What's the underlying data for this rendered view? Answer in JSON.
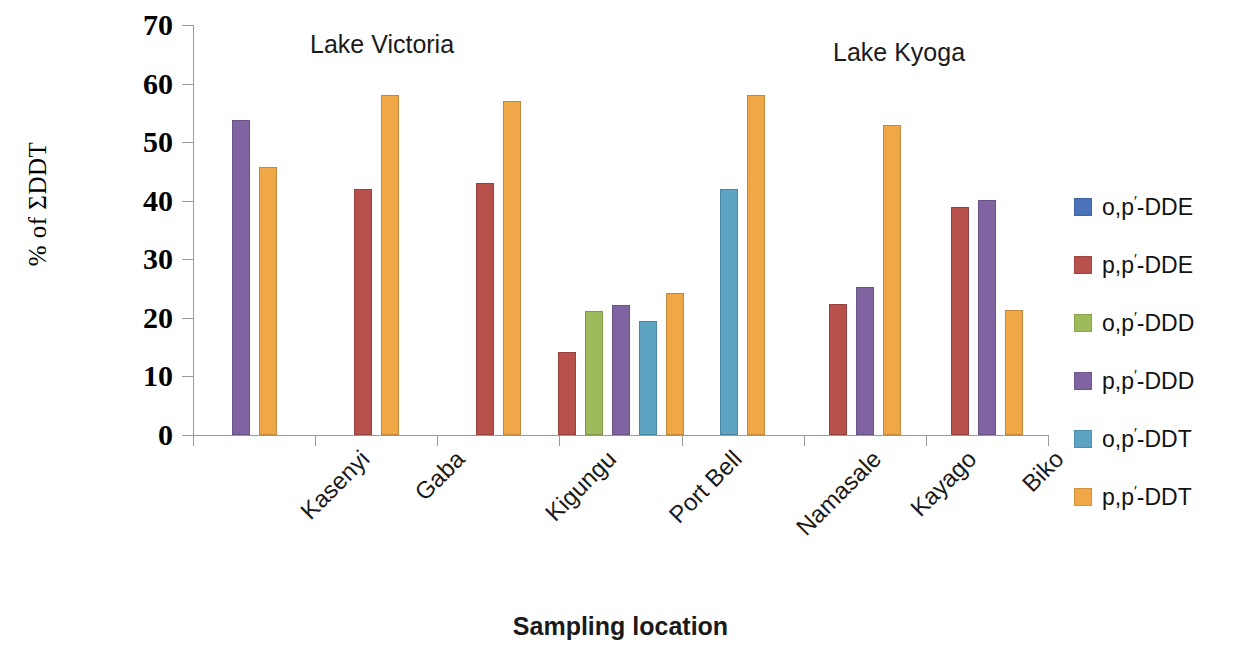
{
  "chart_data": {
    "type": "bar",
    "title": "",
    "xlabel": "Sampling location",
    "ylabel": "% of ΣDDT",
    "ylim": [
      0,
      70
    ],
    "yticks": [
      0,
      10,
      20,
      30,
      40,
      50,
      60,
      70
    ],
    "ytick_labels": [
      "0",
      "10",
      "20",
      "30",
      "40",
      "50",
      "60",
      "70"
    ],
    "grid": false,
    "legend_position": "right",
    "categories": [
      "Kasenyi",
      "Gaba",
      "Kigungu",
      "Port Bell",
      "Namasale",
      "Kayago",
      "Biko"
    ],
    "series": [
      {
        "name": "o,p'-DDE",
        "color": "#4a72b8",
        "values": [
          null,
          null,
          null,
          null,
          null,
          null,
          null
        ]
      },
      {
        "name": "p,p'-DDE",
        "color": "#b8504c",
        "values": [
          null,
          42,
          43,
          14.2,
          null,
          22.3,
          39
        ]
      },
      {
        "name": "o,p'-DDD",
        "color": "#9dbb5a",
        "values": [
          null,
          null,
          null,
          21.2,
          null,
          null,
          null
        ]
      },
      {
        "name": "p,p'-DDD",
        "color": "#8064a2",
        "values": [
          53.8,
          null,
          null,
          22.2,
          null,
          25.3,
          40.1
        ]
      },
      {
        "name": "o,p'-DDT",
        "color": "#5da4c4",
        "values": [
          null,
          null,
          null,
          19.4,
          42,
          null,
          null
        ]
      },
      {
        "name": "p,p'-DDT",
        "color": "#efa747",
        "values": [
          45.8,
          58,
          57,
          24.2,
          58,
          53,
          21.3
        ]
      }
    ],
    "annotations": [
      {
        "text": "Lake Victoria",
        "position": "above-group-2"
      },
      {
        "text": "Lake Kyoga",
        "position": "above-group-5"
      }
    ]
  },
  "axes": {
    "y_title": "% of ΣDDT",
    "x_title": "Sampling location"
  },
  "annotations": {
    "lake_victoria": "Lake Victoria",
    "lake_kyoga": "Lake Kyoga"
  },
  "legend": {
    "items": [
      {
        "label_main": "o,p",
        "label_tail": "-DDE",
        "color": "#4a72b8"
      },
      {
        "label_main": "p,p",
        "label_tail": "-DDE",
        "color": "#b8504c"
      },
      {
        "label_main": "o,p",
        "label_tail": "-DDD",
        "color": "#9dbb5a"
      },
      {
        "label_main": "p,p",
        "label_tail": "-DDD",
        "color": "#8064a2"
      },
      {
        "label_main": "o,p",
        "label_tail": "-DDT",
        "color": "#5da4c4"
      },
      {
        "label_main": "p,p",
        "label_tail": "-DDT",
        "color": "#efa747"
      }
    ]
  }
}
